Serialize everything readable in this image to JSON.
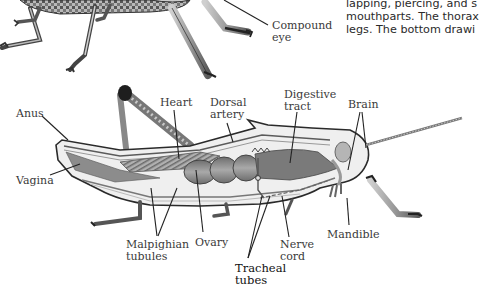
{
  "figure": {
    "style": "grayscale illustration",
    "top_drawing": {
      "description": "External view of grasshopper legs and underside (cropped)",
      "labels": [
        {
          "id": "compound-eye",
          "lines": [
            "Compound",
            "eye"
          ]
        }
      ]
    },
    "bottom_drawing": {
      "description": "Internal anatomy cross-section of grasshopper",
      "labels": [
        {
          "id": "anus",
          "lines": [
            "Anus"
          ]
        },
        {
          "id": "vagina",
          "lines": [
            "Vagina"
          ]
        },
        {
          "id": "heart",
          "lines": [
            "Heart"
          ]
        },
        {
          "id": "dorsal-artery",
          "lines": [
            "Dorsal",
            "artery"
          ]
        },
        {
          "id": "digestive-tract",
          "lines": [
            "Digestive",
            "tract"
          ]
        },
        {
          "id": "brain",
          "lines": [
            "Brain"
          ]
        },
        {
          "id": "malpighian-tubules",
          "lines": [
            "Malpighian",
            "tubules"
          ]
        },
        {
          "id": "ovary",
          "lines": [
            "Ovary"
          ]
        },
        {
          "id": "nerve-cord",
          "lines": [
            "Nerve",
            "cord"
          ]
        },
        {
          "id": "mandible",
          "lines": [
            "Mandible"
          ]
        },
        {
          "id": "tracheal-tubes",
          "lines": [
            "Tracheal",
            "tubes"
          ]
        }
      ]
    }
  },
  "caption": {
    "lines": [
      "lapping, piercing, and s",
      "mouthparts. The thorax",
      "legs. The bottom drawi"
    ]
  },
  "colors": {
    "background": "#ffffff",
    "ink": "#222222",
    "body_fill": "#e8e8e8",
    "muscle": "#8a8a8a",
    "dark": "#3a3a3a"
  }
}
